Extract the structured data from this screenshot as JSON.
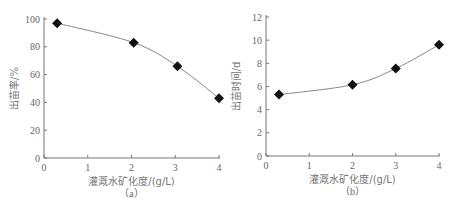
{
  "chart_data": [
    {
      "type": "line",
      "id": "a",
      "caption": "（a）",
      "xlabel": "灌溉水矿化度/(g/L)",
      "ylabel": "出苗率/%",
      "xlim": [
        0,
        4
      ],
      "ylim": [
        0,
        100
      ],
      "xticks": [
        0,
        1,
        2,
        3,
        4
      ],
      "yticks": [
        0,
        20,
        40,
        60,
        80,
        100
      ],
      "grid": false,
      "marker": "diamond",
      "series": [
        {
          "name": "出苗率",
          "x": [
            0.3,
            2.05,
            3.05,
            4.0
          ],
          "y": [
            97,
            83,
            66,
            43
          ]
        }
      ]
    },
    {
      "type": "line",
      "id": "b",
      "caption": "（b）",
      "xlabel": "灌溉水矿化度/(g/L)",
      "ylabel": "出苗时间/d",
      "xlim": [
        0,
        4
      ],
      "ylim": [
        0,
        12
      ],
      "xticks": [
        0,
        1,
        2,
        3,
        4
      ],
      "yticks": [
        0,
        2,
        4,
        6,
        8,
        10,
        12
      ],
      "grid": false,
      "marker": "diamond",
      "series": [
        {
          "name": "出苗时间",
          "x": [
            0.3,
            2.0,
            3.0,
            4.0
          ],
          "y": [
            5.3,
            6.15,
            7.55,
            9.6
          ]
        }
      ]
    }
  ],
  "layout": [
    {
      "x0": 44,
      "x1": 219,
      "y0": 158,
      "y1": 19
    },
    {
      "x0": 266,
      "x1": 439,
      "y0": 156,
      "y1": 17
    }
  ],
  "colors": {
    "axis": "#777777",
    "line": "#888888",
    "marker": "#111111",
    "text": "#666666"
  }
}
